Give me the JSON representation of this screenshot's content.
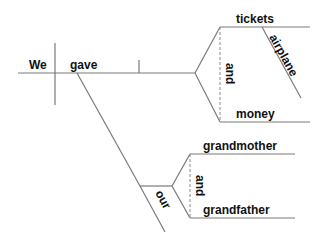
{
  "diagram": {
    "type": "sentence-diagram",
    "sentence": "We gave airplane tickets and money to our grandmother and grandfather",
    "subject": "We",
    "verb": "gave",
    "direct_objects": {
      "conjunction": "and",
      "items": [
        {
          "word": "tickets",
          "modifiers": [
            "airplane"
          ]
        },
        {
          "word": "money",
          "modifiers": []
        }
      ]
    },
    "indirect_objects": {
      "modifier": "our",
      "conjunction": "and",
      "items": [
        "grandmother",
        "grandfather"
      ]
    },
    "colors": {
      "line": "#7a7a7a",
      "text": "#111111"
    }
  }
}
